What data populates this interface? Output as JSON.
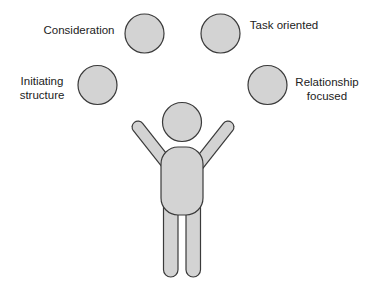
{
  "diagram": {
    "colors": {
      "fill": "#d3d3d3",
      "stroke": "#3a3a3a",
      "text": "#222222",
      "background": "#ffffff"
    },
    "bubbles": [
      {
        "id": "consideration",
        "lines": [
          "Consideration"
        ],
        "position": "top-left"
      },
      {
        "id": "task-oriented",
        "lines": [
          "Task oriented"
        ],
        "position": "top-right"
      },
      {
        "id": "initiating-structure",
        "lines": [
          "Initiating",
          "structure"
        ],
        "position": "middle-left"
      },
      {
        "id": "relationship-focused",
        "lines": [
          "Relationship",
          "focused"
        ],
        "position": "middle-right"
      }
    ],
    "figure": {
      "description": "person-with-raised-arms"
    }
  }
}
